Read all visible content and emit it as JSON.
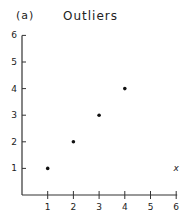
{
  "panel_label": "(a)",
  "title": "Outliers",
  "chart_data": {
    "type": "scatter",
    "title": "Outliers",
    "panel": "(a)",
    "xlabel": "",
    "ylabel": "",
    "xlim": [
      0,
      6
    ],
    "ylim": [
      0,
      6
    ],
    "x_ticks": [
      1,
      2,
      3,
      4,
      5,
      6
    ],
    "y_ticks": [
      1,
      2,
      3,
      4,
      5,
      6
    ],
    "grid": false,
    "legend": null,
    "series": [
      {
        "name": "points",
        "marker": "dot",
        "x": [
          1,
          2,
          3,
          4
        ],
        "y": [
          1,
          2,
          3,
          4
        ]
      },
      {
        "name": "outlier",
        "marker": "x",
        "x": [
          6
        ],
        "y": [
          1
        ]
      }
    ]
  }
}
